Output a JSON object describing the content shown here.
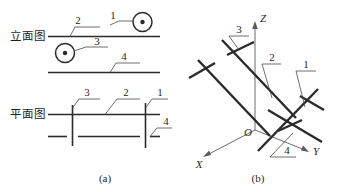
{
  "figure": {
    "title": "",
    "sub_captions": [
      {
        "id": "a",
        "text": "(a)"
      },
      {
        "id": "b",
        "text": "(b)"
      }
    ]
  },
  "panel_a": {
    "views": [
      {
        "name": "elevation",
        "label": "立面图"
      },
      {
        "name": "plan",
        "label": "平面图"
      }
    ],
    "elevation": {
      "part_numbers": [
        "2",
        "1",
        "3",
        "4"
      ],
      "end_view_markers": [
        {
          "name": "dot-circle-upper",
          "symbol": "⊙"
        },
        {
          "name": "dot-circle-lower",
          "symbol": "⊙"
        }
      ]
    },
    "plan": {
      "part_numbers": [
        "3",
        "2",
        "1",
        "4"
      ]
    }
  },
  "panel_b": {
    "axes": [
      {
        "name": "z-axis",
        "label": "Z"
      },
      {
        "name": "x-axis",
        "label": "X"
      },
      {
        "name": "y-axis",
        "label": "Y"
      },
      {
        "name": "origin",
        "label": "O"
      }
    ],
    "part_numbers": [
      "3",
      "2",
      "1",
      "4"
    ]
  },
  "colors": {
    "line": "#2b2b2b",
    "leader": "#4a4a4a",
    "axis": "#5a5a5a",
    "text": "#1f1f1f",
    "background": "#ffffff"
  }
}
